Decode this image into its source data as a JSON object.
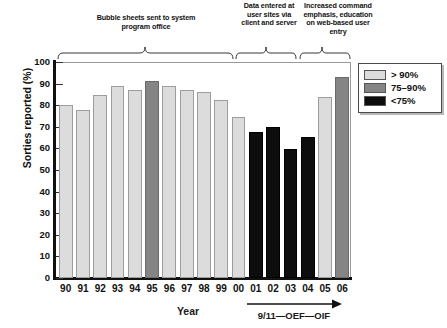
{
  "chart_data": {
    "type": "bar",
    "title": "",
    "xlabel": "Year",
    "ylabel": "Sorties reported (%)",
    "ylim": [
      0,
      100
    ],
    "yticks": [
      0,
      10,
      20,
      30,
      40,
      50,
      60,
      70,
      80,
      90,
      100
    ],
    "grid": false,
    "legend_position": "right",
    "categories": [
      "90",
      "91",
      "92",
      "93",
      "94",
      "95",
      "96",
      "97",
      "98",
      "99",
      "00",
      "01",
      "02",
      "03",
      "04",
      "05",
      "06"
    ],
    "values": [
      80,
      78,
      84.5,
      89,
      87,
      91,
      89,
      87,
      86,
      82.5,
      74.5,
      67.5,
      70,
      59.5,
      65.5,
      84,
      93
    ],
    "bar_categories": [
      "light",
      "light",
      "light",
      "light",
      "light",
      "mid",
      "light",
      "light",
      "light",
      "light",
      "light",
      "dark",
      "dark",
      "dark",
      "dark",
      "light",
      "mid"
    ],
    "legend": [
      {
        "key": "light",
        "label": "> 90%",
        "color": "#dcdcdc"
      },
      {
        "key": "mid",
        "label": "75–90%",
        "color": "#858585"
      },
      {
        "key": "dark",
        "label": "<75%",
        "color": "#0d0d0d"
      }
    ],
    "annotations": [
      {
        "id": "bubble-sheets",
        "text": "Bubble sheets sent to system program office",
        "span": [
          "90",
          "00"
        ]
      },
      {
        "id": "data-entered",
        "text": "Data entered at user sites via client and server",
        "span": [
          "01",
          "04"
        ]
      },
      {
        "id": "command-emphasis",
        "text": "Increased command emphasis, education on web-based user entry",
        "span": [
          "05",
          "06"
        ]
      }
    ],
    "axis_note": "9/11—OEF—OIF"
  }
}
